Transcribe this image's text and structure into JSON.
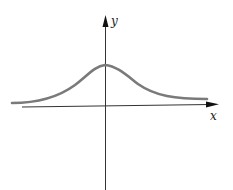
{
  "diagram": {
    "type": "function-graph",
    "axes": {
      "x_label": "x",
      "y_label": "y"
    },
    "colors": {
      "curve": "#7a7a7a",
      "axes": "#222222",
      "background": "#ffffff"
    }
  }
}
